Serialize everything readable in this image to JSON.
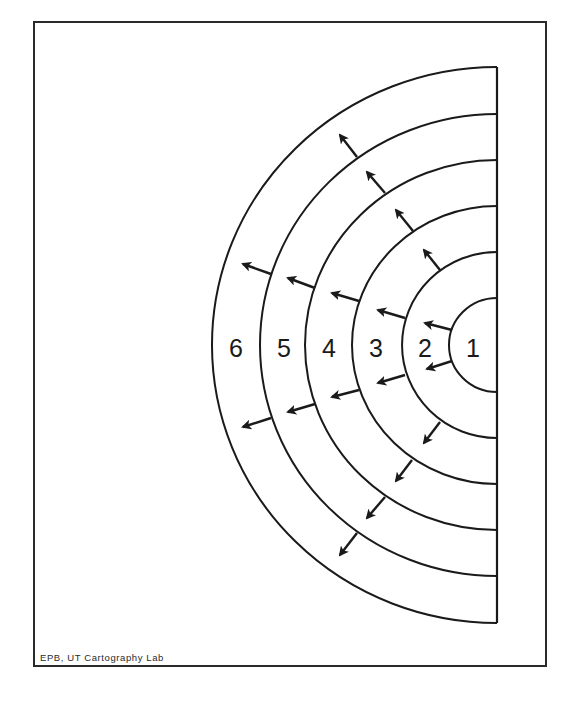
{
  "diagram": {
    "rings": [
      {
        "label": "1",
        "rx": 48,
        "ry": 47
      },
      {
        "label": "2",
        "rx": 95,
        "ry": 93
      },
      {
        "label": "3",
        "rx": 145,
        "ry": 139
      },
      {
        "label": "4",
        "rx": 192,
        "ry": 185
      },
      {
        "label": "5",
        "rx": 237,
        "ry": 231
      },
      {
        "label": "6",
        "rx": 285,
        "ry": 278
      }
    ],
    "label_positions": [
      {
        "label": "1",
        "x": 473,
        "y": 357
      },
      {
        "label": "2",
        "x": 425,
        "y": 357
      },
      {
        "label": "3",
        "x": 376,
        "y": 357
      },
      {
        "label": "4",
        "x": 329,
        "y": 357
      },
      {
        "label": "5",
        "x": 284,
        "y": 357
      },
      {
        "label": "6",
        "x": 236,
        "y": 357
      }
    ],
    "arrows": [
      {
        "x1": 452,
        "y1": 330,
        "x2": 425,
        "y2": 323
      },
      {
        "x1": 452,
        "y1": 361,
        "x2": 427,
        "y2": 369
      },
      {
        "x1": 405,
        "y1": 318,
        "x2": 378,
        "y2": 310
      },
      {
        "x1": 405,
        "y1": 375,
        "x2": 378,
        "y2": 383
      },
      {
        "x1": 359,
        "y1": 301,
        "x2": 332,
        "y2": 293
      },
      {
        "x1": 359,
        "y1": 390,
        "x2": 332,
        "y2": 397
      },
      {
        "x1": 315,
        "y1": 288,
        "x2": 288,
        "y2": 278
      },
      {
        "x1": 315,
        "y1": 404,
        "x2": 288,
        "y2": 412
      },
      {
        "x1": 271,
        "y1": 274,
        "x2": 243,
        "y2": 264
      },
      {
        "x1": 271,
        "y1": 418,
        "x2": 243,
        "y2": 427
      },
      {
        "x1": 440,
        "y1": 270,
        "x2": 424,
        "y2": 250
      },
      {
        "x1": 413,
        "y1": 231,
        "x2": 396,
        "y2": 210
      },
      {
        "x1": 385,
        "y1": 193,
        "x2": 367,
        "y2": 172
      },
      {
        "x1": 357,
        "y1": 157,
        "x2": 340,
        "y2": 135
      },
      {
        "x1": 440,
        "y1": 422,
        "x2": 424,
        "y2": 443
      },
      {
        "x1": 412,
        "y1": 460,
        "x2": 396,
        "y2": 481
      },
      {
        "x1": 385,
        "y1": 497,
        "x2": 367,
        "y2": 518
      },
      {
        "x1": 357,
        "y1": 533,
        "x2": 340,
        "y2": 555
      }
    ],
    "center": {
      "x": 497,
      "y": 345
    },
    "baseline": {
      "x": 497,
      "y1": 67,
      "y2": 623
    },
    "stroke_color": "#1a1a1a"
  },
  "credit": "EPB, UT Cartography Lab"
}
